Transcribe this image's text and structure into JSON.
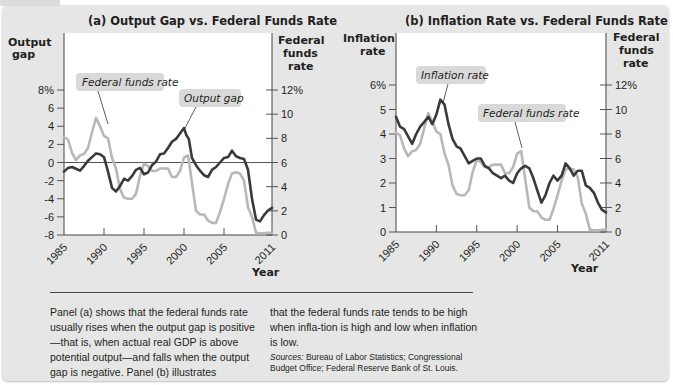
{
  "chart_data": [
    {
      "type": "line",
      "panel": "a",
      "title": "(a) Output Gap vs. Federal Funds Rate",
      "xlabel": "Year",
      "ylabel_left": [
        "Output",
        "gap"
      ],
      "ylabel_right": [
        "Federal",
        "funds",
        "rate"
      ],
      "x_ticks": [
        "1985",
        "1990",
        "1995",
        "2000",
        "2005",
        "2011"
      ],
      "xlim": [
        1985,
        2011
      ],
      "y_left_ticks": [
        "8%",
        "6",
        "4",
        "2",
        "0",
        "-2",
        "-4",
        "-6",
        "-8"
      ],
      "y_left_lim": [
        -8,
        8
      ],
      "y_right_ticks": [
        "12%",
        "10",
        "8",
        "6",
        "4",
        "2",
        "0"
      ],
      "y_right_lim": [
        0,
        12
      ],
      "zero_line": true,
      "annotations": [
        "Federal funds rate",
        "Output gap"
      ],
      "series": [
        {
          "name": "Output gap",
          "axis": "left",
          "color": "#3a3a3a",
          "x": [
            1985,
            1985.5,
            1986,
            1986.5,
            1987,
            1987.5,
            1988,
            1988.5,
            1989,
            1989.5,
            1990,
            1990.5,
            1991,
            1991.5,
            1992,
            1992.5,
            1993,
            1993.5,
            1994,
            1994.5,
            1995,
            1995.5,
            1996,
            1996.5,
            1997,
            1997.5,
            1998,
            1998.5,
            1999,
            1999.5,
            2000,
            2000.3,
            2000.6,
            2001,
            2001.5,
            2002,
            2002.5,
            2003,
            2003.5,
            2004,
            2004.5,
            2005,
            2005.5,
            2006,
            2006.5,
            2007,
            2007.5,
            2008,
            2008.5,
            2009,
            2009.5,
            2010,
            2010.5,
            2011
          ],
          "values": [
            -1.0,
            -0.6,
            -0.5,
            -0.7,
            -0.9,
            -0.4,
            0.2,
            0.6,
            1.0,
            0.9,
            0.6,
            -1.0,
            -2.8,
            -3.2,
            -2.6,
            -1.8,
            -2.0,
            -1.5,
            -0.8,
            -0.6,
            -1.3,
            -1.1,
            -0.3,
            0.1,
            0.9,
            1.0,
            1.6,
            2.3,
            2.6,
            3.2,
            3.8,
            3.0,
            2.6,
            0.5,
            -0.3,
            -0.9,
            -1.4,
            -1.6,
            -0.8,
            -0.5,
            0.0,
            0.5,
            0.6,
            1.3,
            0.7,
            0.5,
            0.4,
            -0.8,
            -4.0,
            -6.3,
            -6.5,
            -5.8,
            -5.3,
            -5.0
          ]
        },
        {
          "name": "Federal funds rate",
          "axis": "right",
          "color": "#b8b8b8",
          "x": [
            1985,
            1985.5,
            1986,
            1986.5,
            1987,
            1987.5,
            1988,
            1988.5,
            1989,
            1989.5,
            1990,
            1990.5,
            1991,
            1991.5,
            1992,
            1992.5,
            1993,
            1993.5,
            1994,
            1994.5,
            1995,
            1995.5,
            1996,
            1996.5,
            1997,
            1997.5,
            1998,
            1998.5,
            1999,
            1999.5,
            2000,
            2000.5,
            2001,
            2001.5,
            2002,
            2002.5,
            2003,
            2003.5,
            2004,
            2004.5,
            2005,
            2005.5,
            2006,
            2006.5,
            2007,
            2007.5,
            2008,
            2008.5,
            2009,
            2009.5,
            2010,
            2010.5,
            2011
          ],
          "values": [
            8.1,
            7.9,
            6.8,
            6.2,
            6.6,
            6.7,
            7.2,
            8.5,
            9.7,
            9.0,
            8.2,
            8.0,
            6.4,
            5.5,
            3.8,
            3.1,
            3.0,
            3.0,
            3.4,
            4.9,
            5.9,
            5.7,
            5.3,
            5.3,
            5.5,
            5.5,
            5.5,
            4.8,
            4.8,
            5.3,
            6.4,
            6.6,
            4.3,
            2.0,
            1.7,
            1.7,
            1.2,
            1.0,
            1.0,
            1.9,
            3.0,
            4.2,
            5.1,
            5.2,
            5.1,
            4.5,
            2.3,
            1.5,
            0.2,
            0.15,
            0.15,
            0.18,
            0.2
          ]
        }
      ]
    },
    {
      "type": "line",
      "panel": "b",
      "title": "(b) Inflation Rate vs. Federal Funds Rate",
      "xlabel": "Year",
      "ylabel_left": [
        "Inflation",
        "rate"
      ],
      "ylabel_right": [
        "Federal",
        "funds",
        "rate"
      ],
      "x_ticks": [
        "1985",
        "1990",
        "1995",
        "2000",
        "2005",
        "2011"
      ],
      "xlim": [
        1985,
        2011
      ],
      "y_left_ticks": [
        "6%",
        "5",
        "4",
        "3",
        "2",
        "1",
        "0"
      ],
      "y_left_lim": [
        0,
        6
      ],
      "y_right_ticks": [
        "12%",
        "10",
        "8",
        "6",
        "4",
        "2",
        "0"
      ],
      "y_right_lim": [
        0,
        12
      ],
      "annotations": [
        "Inflation rate",
        "Federal funds rate"
      ],
      "series": [
        {
          "name": "Inflation rate",
          "axis": "left",
          "color": "#3a3a3a",
          "x": [
            1985,
            1985.5,
            1986,
            1986.5,
            1987,
            1987.5,
            1988,
            1988.5,
            1989,
            1989.5,
            1990,
            1990.5,
            1991,
            1991.5,
            1992,
            1992.5,
            1993,
            1993.5,
            1994,
            1994.5,
            1995,
            1995.5,
            1996,
            1996.5,
            1997,
            1997.5,
            1998,
            1998.5,
            1999,
            1999.5,
            2000,
            2000.5,
            2001,
            2001.5,
            2002,
            2002.5,
            2003,
            2003.5,
            2004,
            2004.5,
            2005,
            2005.5,
            2006,
            2006.5,
            2007,
            2007.5,
            2008,
            2008.5,
            2009,
            2009.5,
            2010,
            2010.5,
            2011
          ],
          "values": [
            4.7,
            4.3,
            4.2,
            3.9,
            3.6,
            4.0,
            4.3,
            4.5,
            4.7,
            4.4,
            4.8,
            5.4,
            5.2,
            4.4,
            3.8,
            3.5,
            3.4,
            3.1,
            2.8,
            2.9,
            3.0,
            3.0,
            2.7,
            2.6,
            2.4,
            2.3,
            2.2,
            2.3,
            2.1,
            2.0,
            2.4,
            2.6,
            2.7,
            2.6,
            2.2,
            1.7,
            1.2,
            1.5,
            2.0,
            2.3,
            2.1,
            2.3,
            2.8,
            2.6,
            2.3,
            2.5,
            2.5,
            1.9,
            1.8,
            1.6,
            1.2,
            0.9,
            0.8
          ]
        },
        {
          "name": "Federal funds rate",
          "axis": "right",
          "color": "#b8b8b8",
          "x": [
            1985,
            1985.5,
            1986,
            1986.5,
            1987,
            1987.5,
            1988,
            1988.5,
            1989,
            1989.5,
            1990,
            1990.5,
            1991,
            1991.5,
            1992,
            1992.5,
            1993,
            1993.5,
            1994,
            1994.5,
            1995,
            1995.5,
            1996,
            1996.5,
            1997,
            1997.5,
            1998,
            1998.5,
            1999,
            1999.5,
            2000,
            2000.5,
            2001,
            2001.5,
            2002,
            2002.5,
            2003,
            2003.5,
            2004,
            2004.5,
            2005,
            2005.5,
            2006,
            2006.5,
            2007,
            2007.5,
            2008,
            2008.5,
            2009,
            2009.5,
            2010,
            2010.5,
            2011
          ],
          "values": [
            8.1,
            7.9,
            6.8,
            6.2,
            6.6,
            6.7,
            7.2,
            8.5,
            9.7,
            9.0,
            8.2,
            8.0,
            6.4,
            5.5,
            3.8,
            3.1,
            3.0,
            3.0,
            3.4,
            4.9,
            5.9,
            5.7,
            5.3,
            5.3,
            5.5,
            5.5,
            5.5,
            4.8,
            4.8,
            5.3,
            6.4,
            6.6,
            4.3,
            2.0,
            1.7,
            1.7,
            1.2,
            1.0,
            1.0,
            1.9,
            3.0,
            4.2,
            5.1,
            5.2,
            5.1,
            4.5,
            2.3,
            1.5,
            0.2,
            0.15,
            0.15,
            0.18,
            0.2
          ]
        }
      ]
    }
  ],
  "caption": {
    "left": "Panel (a) shows that the federal funds rate usually rises when the output gap is positive—that is, when actual real GDP is above potential output—and falls when the output gap is negative. Panel (b) illustrates",
    "right": "that the federal funds rate tends to be high when infla-tion is high and low when inflation is low.",
    "sources_label": "Sources:",
    "sources_text": " Bureau of Labor Statistics; Congressional Budget Office; Federal Reserve Bank of St. Louis."
  },
  "colors": {
    "background": "#e6e6e6",
    "plot_area": "#ffffff",
    "dark_series": "#3a3a3a",
    "light_series": "#b8b8b8",
    "callout_fill": "#d9d9d9"
  }
}
